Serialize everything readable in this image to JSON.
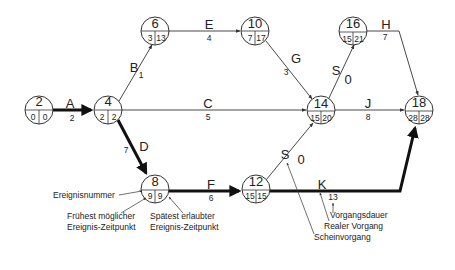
{
  "diagram": {
    "type": "network-plan",
    "nodes": [
      {
        "id": "2",
        "earliest": "0",
        "latest": "0"
      },
      {
        "id": "4",
        "earliest": "2",
        "latest": "2"
      },
      {
        "id": "6",
        "earliest": "3",
        "latest": "13"
      },
      {
        "id": "8",
        "earliest": "9",
        "latest": "9"
      },
      {
        "id": "10",
        "earliest": "7",
        "latest": "17"
      },
      {
        "id": "12",
        "earliest": "15",
        "latest": "15"
      },
      {
        "id": "14",
        "earliest": "15",
        "latest": "20"
      },
      {
        "id": "16",
        "earliest": "15",
        "latest": "21"
      },
      {
        "id": "18",
        "earliest": "28",
        "latest": "28"
      }
    ],
    "activities": [
      {
        "label": "A",
        "duration": "2",
        "from": "2",
        "to": "4",
        "critical": true
      },
      {
        "label": "B",
        "duration": "1",
        "from": "4",
        "to": "6",
        "critical": false
      },
      {
        "label": "C",
        "duration": "5",
        "from": "4",
        "to": "14",
        "critical": false
      },
      {
        "label": "D",
        "duration": "7",
        "from": "4",
        "to": "8",
        "critical": true
      },
      {
        "label": "E",
        "duration": "4",
        "from": "6",
        "to": "10",
        "critical": false
      },
      {
        "label": "F",
        "duration": "6",
        "from": "8",
        "to": "12",
        "critical": true
      },
      {
        "label": "G",
        "duration": "3",
        "from": "10",
        "to": "14",
        "critical": false
      },
      {
        "label": "S",
        "duration": "0",
        "from": "12",
        "to": "14",
        "critical": false
      },
      {
        "label": "S",
        "duration": "0",
        "from": "14",
        "to": "16",
        "critical": false
      },
      {
        "label": "H",
        "duration": "7",
        "from": "16",
        "to": "18",
        "critical": false
      },
      {
        "label": "J",
        "duration": "8",
        "from": "14",
        "to": "18",
        "critical": false
      },
      {
        "label": "K",
        "duration": "13",
        "from": "12",
        "to": "18",
        "critical": true
      }
    ],
    "legend": {
      "event_number": "Ereignisnummer",
      "earliest_line1": "Frühest möglicher",
      "earliest_line2": "Ereignis-Zeitpunkt",
      "latest_line1": "Spätest erlaubter",
      "latest_line2": "Ereignis-Zeitpunkt",
      "duration": "Vorgangsdauer",
      "real_activity": "Realer Vorgang",
      "dummy_activity": "Scheinvorgang"
    },
    "colors": {
      "line": "#333333",
      "background": "#ffffff"
    }
  }
}
